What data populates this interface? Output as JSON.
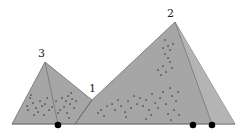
{
  "diagram": {
    "width": 246,
    "height": 135,
    "colors": {
      "fill": "#a6a6a6",
      "fill_light": "#b4b4b4",
      "edge": "#6e6e6e",
      "point": "#2a2a2a",
      "marker": "#000000",
      "label": "#222222"
    },
    "vertices": {
      "left_base": [
        12,
        124
      ],
      "apex3": [
        45,
        62
      ],
      "valley1": [
        92,
        100
      ],
      "apex2": [
        175,
        22
      ],
      "right_base": [
        235,
        124
      ]
    },
    "labels": [
      {
        "id": "label-3",
        "text": "3",
        "x": 38,
        "y": 57
      },
      {
        "id": "label-1",
        "text": "1",
        "x": 89,
        "y": 92
      },
      {
        "id": "label-2",
        "text": "2",
        "x": 167,
        "y": 17
      }
    ],
    "inner_lines": [
      {
        "from": [
          45,
          62
        ],
        "to": [
          58,
          124
        ]
      },
      {
        "from": [
          92,
          100
        ],
        "to": [
          75,
          124
        ]
      },
      {
        "from": [
          175,
          22
        ],
        "to": [
          212,
          124
        ]
      }
    ],
    "markers": [
      {
        "x": 58,
        "y": 125,
        "r": 3.3
      },
      {
        "x": 193,
        "y": 125,
        "r": 3.3
      },
      {
        "x": 212,
        "y": 125,
        "r": 3.3
      }
    ],
    "scatter_points": [
      [
        30,
        98
      ],
      [
        33,
        103
      ],
      [
        36,
        108
      ],
      [
        28,
        110
      ],
      [
        40,
        101
      ],
      [
        42,
        106
      ],
      [
        38,
        112
      ],
      [
        45,
        104
      ],
      [
        47,
        98
      ],
      [
        34,
        115
      ],
      [
        44,
        115
      ],
      [
        49,
        110
      ],
      [
        62,
        98
      ],
      [
        66,
        101
      ],
      [
        68,
        96
      ],
      [
        70,
        104
      ],
      [
        64,
        107
      ],
      [
        72,
        99
      ],
      [
        74,
        108
      ],
      [
        60,
        110
      ],
      [
        67,
        113
      ],
      [
        71,
        93
      ],
      [
        76,
        101
      ],
      [
        69,
        118
      ],
      [
        27,
        106
      ],
      [
        31,
        95
      ],
      [
        52,
        107
      ],
      [
        56,
        101
      ],
      [
        58,
        113
      ],
      [
        112,
        104
      ],
      [
        115,
        110
      ],
      [
        118,
        100
      ],
      [
        121,
        106
      ],
      [
        125,
        112
      ],
      [
        128,
        101
      ],
      [
        131,
        108
      ],
      [
        134,
        96
      ],
      [
        137,
        104
      ],
      [
        126,
        117
      ],
      [
        140,
        98
      ],
      [
        143,
        106
      ],
      [
        146,
        100
      ],
      [
        149,
        110
      ],
      [
        152,
        94
      ],
      [
        155,
        103
      ],
      [
        158,
        108
      ],
      [
        151,
        115
      ],
      [
        146,
        119
      ],
      [
        160,
        98
      ],
      [
        163,
        92
      ],
      [
        166,
        104
      ],
      [
        170,
        88
      ],
      [
        172,
        96
      ],
      [
        174,
        110
      ],
      [
        168,
        114
      ],
      [
        176,
        101
      ],
      [
        178,
        92
      ],
      [
        179,
        115
      ],
      [
        171,
        120
      ],
      [
        165,
        54
      ],
      [
        168,
        58
      ],
      [
        170,
        62
      ],
      [
        163,
        66
      ],
      [
        172,
        68
      ],
      [
        166,
        72
      ],
      [
        161,
        75
      ],
      [
        158,
        70
      ],
      [
        165,
        40
      ],
      [
        168,
        46
      ],
      [
        170,
        50
      ],
      [
        163,
        48
      ],
      [
        173,
        44
      ],
      [
        101,
        110
      ],
      [
        104,
        116
      ],
      [
        107,
        106
      ],
      [
        98,
        113
      ]
    ]
  }
}
